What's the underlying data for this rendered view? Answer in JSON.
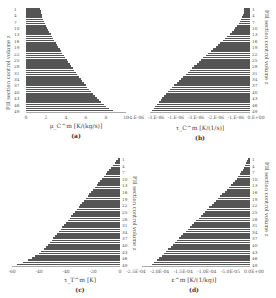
{
  "chart_data": [
    {
      "type": "bar",
      "orientation": "horizontal",
      "panel": "(a)",
      "title": "",
      "xlabel": "μ_C^m [K/(kg/s)]",
      "ylabel": "Fill section control volume z",
      "xlim": [
        0,
        10
      ],
      "xticks": [
        "0",
        "2",
        "4",
        "6",
        "8",
        "10"
      ],
      "yticks": [
        "1",
        "4",
        "7",
        "10",
        "13",
        "16",
        "19",
        "22",
        "25",
        "28",
        "31",
        "34",
        "37",
        "40",
        "43",
        "46",
        "49"
      ],
      "y_axis_side": "left",
      "categories": [
        1,
        2,
        3,
        4,
        5,
        6,
        7,
        8,
        9,
        10,
        11,
        12,
        13,
        14,
        15,
        16,
        17,
        18,
        19,
        20,
        21,
        22,
        23,
        24,
        25,
        26,
        27,
        28,
        29,
        30,
        31,
        32,
        33,
        34,
        35,
        36,
        37,
        38,
        39,
        40,
        41,
        42,
        43,
        44,
        45,
        46,
        47,
        48,
        49
      ],
      "values": [
        1.4,
        1.45,
        1.5,
        1.55,
        1.6,
        1.7,
        1.8,
        1.9,
        2.0,
        2.1,
        2.2,
        2.3,
        2.45,
        2.55,
        2.7,
        2.8,
        2.95,
        3.05,
        3.2,
        3.35,
        3.5,
        3.6,
        3.75,
        3.9,
        4.05,
        4.2,
        4.35,
        4.5,
        4.65,
        4.8,
        4.95,
        5.1,
        5.3,
        5.45,
        5.6,
        5.8,
        5.95,
        6.1,
        6.3,
        6.5,
        6.7,
        6.9,
        7.1,
        7.3,
        7.5,
        7.75,
        8.0,
        8.3,
        8.7
      ]
    },
    {
      "type": "bar",
      "orientation": "horizontal",
      "panel": "(b)",
      "title": "",
      "xlabel": "τ_C^m [K/(1/s)]",
      "ylabel": "Fill section control volume z",
      "xlim": [
        -4.5e-06,
        0
      ],
      "xticks": [
        "-4.E-06",
        "-3.E-06",
        "-1.E-06",
        "-3.E-06",
        "-2.E-06",
        "-1.E-06",
        "0.E+00"
      ],
      "yticks": [
        "1",
        "4",
        "7",
        "10",
        "13",
        "16",
        "19",
        "22",
        "25",
        "28",
        "31",
        "34",
        "37",
        "40",
        "43",
        "46",
        "49"
      ],
      "y_axis_side": "right",
      "categories": [
        1,
        2,
        3,
        4,
        5,
        6,
        7,
        8,
        9,
        10,
        11,
        12,
        13,
        14,
        15,
        16,
        17,
        18,
        19,
        20,
        21,
        22,
        23,
        24,
        25,
        26,
        27,
        28,
        29,
        30,
        31,
        32,
        33,
        34,
        35,
        36,
        37,
        38,
        39,
        40,
        41,
        42,
        43,
        44,
        45,
        46,
        47,
        48,
        49
      ],
      "values": [
        -2.5e-07,
        -2.7e-07,
        -2.9e-07,
        -3.2e-07,
        -3.6e-07,
        -4e-07,
        -4.5e-07,
        -5.1e-07,
        -5.8e-07,
        -6.6e-07,
        -7.4e-07,
        -8.3e-07,
        -9.2e-07,
        -1.02e-06,
        -1.12e-06,
        -1.22e-06,
        -1.33e-06,
        -1.44e-06,
        -1.55e-06,
        -1.66e-06,
        -1.77e-06,
        -1.88e-06,
        -1.99e-06,
        -2.1e-06,
        -2.2e-06,
        -2.3e-06,
        -2.4e-06,
        -2.5e-06,
        -2.6e-06,
        -2.7e-06,
        -2.8e-06,
        -2.9e-06,
        -3e-06,
        -3.1e-06,
        -3.2e-06,
        -3.3e-06,
        -3.4e-06,
        -3.5e-06,
        -3.6e-06,
        -3.7e-06,
        -3.78e-06,
        -3.86e-06,
        -3.94e-06,
        -4.02e-06,
        -4.1e-06,
        -4.18e-06,
        -4.26e-06,
        -4.34e-06,
        -4.42e-06
      ]
    },
    {
      "type": "bar",
      "orientation": "horizontal",
      "panel": "(c)",
      "title": "",
      "xlabel": "τ_T^m [K]",
      "ylabel": "Fill section control volume z",
      "xlim": [
        -60,
        0
      ],
      "xticks": [
        "-60",
        "-40",
        "-40",
        "-20",
        "0"
      ],
      "yticks": [
        "1",
        "4",
        "7",
        "10",
        "13",
        "16",
        "19",
        "22",
        "25",
        "28",
        "31",
        "34",
        "37",
        "40",
        "43",
        "46",
        "49"
      ],
      "y_axis_side": "right",
      "categories": [
        1,
        2,
        3,
        4,
        5,
        6,
        7,
        8,
        9,
        10,
        11,
        12,
        13,
        14,
        15,
        16,
        17,
        18,
        19,
        20,
        21,
        22,
        23,
        24,
        25,
        26,
        27,
        28,
        29,
        30,
        31,
        32,
        33,
        34,
        35,
        36,
        37,
        38,
        39,
        40,
        41,
        42,
        43,
        44,
        45,
        46,
        47,
        48,
        49
      ],
      "values": [
        -1,
        -2,
        -3,
        -4,
        -5,
        -6,
        -7,
        -8,
        -9,
        -10,
        -11,
        -12,
        -13,
        -14,
        -15,
        -16,
        -17,
        -18,
        -19,
        -20,
        -21,
        -22,
        -23,
        -24,
        -25,
        -26,
        -27,
        -28,
        -29,
        -30,
        -31,
        -32,
        -33,
        -34,
        -35,
        -36,
        -37,
        -38,
        -39,
        -40,
        -41,
        -42,
        -44,
        -45,
        -47,
        -49,
        -51,
        -54,
        -57
      ]
    },
    {
      "type": "bar",
      "orientation": "horizontal",
      "panel": "(d)",
      "title": "",
      "xlabel": "ε^m [K/(1/kg)]",
      "ylabel": "Fill section control volume z",
      "xlim": [
        -0.00025,
        0
      ],
      "xticks": [
        "-2.5E-04",
        "-2.0E-04",
        "-1.5E-04",
        "-1.0E-04",
        "-5.0E-05",
        "0.0E+00"
      ],
      "yticks": [
        "1",
        "4",
        "7",
        "10",
        "13",
        "16",
        "19",
        "22",
        "25",
        "28",
        "31",
        "34",
        "37",
        "40",
        "43",
        "46",
        "49"
      ],
      "y_axis_side": "right",
      "categories": [
        1,
        2,
        3,
        4,
        5,
        6,
        7,
        8,
        9,
        10,
        11,
        12,
        13,
        14,
        15,
        16,
        17,
        18,
        19,
        20,
        21,
        22,
        23,
        24,
        25,
        26,
        27,
        28,
        29,
        30,
        31,
        32,
        33,
        34,
        35,
        36,
        37,
        38,
        39,
        40,
        41,
        42,
        43,
        44,
        45,
        46,
        47,
        48,
        49
      ],
      "values": [
        -5e-06,
        -7e-06,
        -9e-06,
        -1.1e-05,
        -1.4e-05,
        -1.7e-05,
        -2e-05,
        -2.3e-05,
        -2.7e-05,
        -3.1e-05,
        -3.5e-05,
        -3.9e-05,
        -4.4e-05,
        -4.9e-05,
        -5.4e-05,
        -5.9e-05,
        -6.4e-05,
        -6.9e-05,
        -7.4e-05,
        -7.9e-05,
        -8.4e-05,
        -8.9e-05,
        -9.4e-05,
        -9.9e-05,
        -0.000104,
        -0.000109,
        -0.000114,
        -0.000119,
        -0.000124,
        -0.000129,
        -0.000134,
        -0.000139,
        -0.000144,
        -0.000149,
        -0.000154,
        -0.000159,
        -0.000164,
        -0.000169,
        -0.000174,
        -0.000179,
        -0.000184,
        -0.000189,
        -0.000194,
        -0.000199,
        -0.000204,
        -0.00021,
        -0.000216,
        -0.000222,
        -0.000228
      ]
    }
  ],
  "panels": {
    "a": {
      "caption": "(a)",
      "xlabel": "μ_C^m  [K/(kg/s)]",
      "ylabel": "Fill section control volume z",
      "xticks": [
        "0",
        "2",
        "4",
        "6",
        "8",
        "10"
      ],
      "yticks": [
        "1",
        "4",
        "7",
        "10",
        "13",
        "16",
        "19",
        "22",
        "25",
        "28",
        "31",
        "34",
        "37",
        "40",
        "43",
        "46",
        "49"
      ]
    },
    "b": {
      "caption": "(b)",
      "xlabel": "τ_C^m  [K/(1/s)]",
      "ylabel": "Fill section control volume z",
      "xticks": [
        "-4.E-06",
        "-3.E-06",
        "-1.E-06",
        "-3.E-06",
        "-2.E-06",
        "-1.E-06",
        "0.E+00"
      ],
      "yticks": [
        "1",
        "4",
        "7",
        "10",
        "13",
        "16",
        "19",
        "22",
        "25",
        "28",
        "31",
        "34",
        "37",
        "40",
        "43",
        "46",
        "49"
      ]
    },
    "c": {
      "caption": "(c)",
      "xlabel": "τ_T^m  [K]",
      "ylabel": "Fill section control volume z",
      "xticks": [
        "-60",
        "-40",
        "-40",
        "-20",
        "0"
      ],
      "yticks": [
        "1",
        "4",
        "7",
        "10",
        "13",
        "16",
        "19",
        "22",
        "25",
        "28",
        "31",
        "34",
        "37",
        "40",
        "43",
        "46",
        "49"
      ]
    },
    "d": {
      "caption": "(d)",
      "xlabel": "ε^m  [K/(1/kg)]",
      "ylabel": "Fill section control volume z",
      "xticks": [
        "-2.5E-04",
        "-2.0E-04",
        "-1.5E-04",
        "-1.0E-04",
        "-5.0E-05",
        "0.0E+00"
      ],
      "yticks": [
        "1",
        "4",
        "7",
        "10",
        "13",
        "16",
        "19",
        "22",
        "25",
        "28",
        "31",
        "34",
        "37",
        "40",
        "43",
        "46",
        "49"
      ]
    }
  },
  "colors": {
    "bar": "#555555",
    "text": "#444444",
    "background": "#ffffff"
  }
}
